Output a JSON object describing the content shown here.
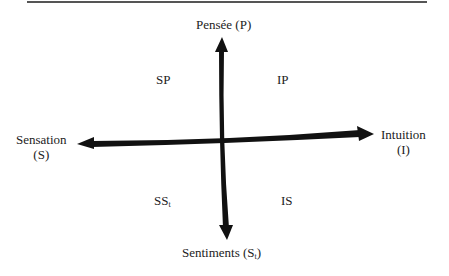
{
  "diagram": {
    "type": "quadrant",
    "axes": {
      "top": {
        "label": "Pensée (P)"
      },
      "bottom": {
        "label_main": "Sentiments (S",
        "label_sub": "t",
        "label_end": ")"
      },
      "left": {
        "line1": "Sensation",
        "line2": "(S)"
      },
      "right": {
        "line1": "Intuition",
        "line2": "(I)"
      }
    },
    "quadrants": {
      "top_left": {
        "label": "SP"
      },
      "top_right": {
        "label": "IP"
      },
      "bottom_left": {
        "label_main": "SS",
        "label_sub": "t"
      },
      "bottom_right": {
        "label": "IS"
      }
    },
    "colors": {
      "arrow": "#111111",
      "rule": "#555555",
      "text": "#222222"
    }
  }
}
